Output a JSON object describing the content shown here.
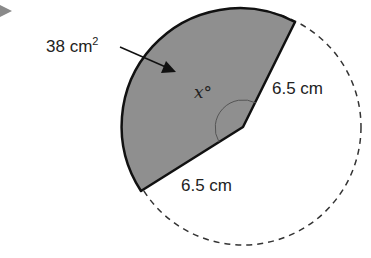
{
  "diagram": {
    "type": "circle-sector",
    "area_label": "38 cm",
    "area_unit_exp": "2",
    "angle_label_var": "x",
    "angle_label_deg": "°",
    "radius_label_right": "6.5 cm",
    "radius_label_bottom": "6.5 cm",
    "colors": {
      "sector_fill": "#8f8f8f",
      "outline": "#111111",
      "dashed_circle": "#333333",
      "marker": "#7a7a7a"
    }
  }
}
